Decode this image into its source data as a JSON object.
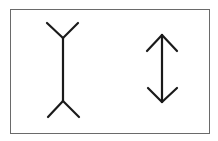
{
  "title": "Müller-Lyer illusion",
  "figures": [
    {
      "id": "fins-out",
      "description": "Vertical line with outward-pointing fins at both ends"
    },
    {
      "id": "fins-in",
      "description": "Vertical line with inward-pointing arrowheads at both ends"
    }
  ],
  "colors": {
    "line": "#1a1a1a",
    "frame": "#6a6a6a",
    "background": "#ffffff"
  }
}
